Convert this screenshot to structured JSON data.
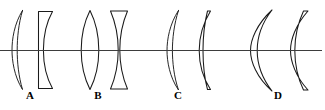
{
  "figure": {
    "background_color": "#ffffff",
    "line_color": "#1a1a1a",
    "axis_color": "#3d3d3d",
    "width": 325,
    "height": 110,
    "axis": {
      "name": "optical-axis",
      "y": 50,
      "x_start": 0,
      "x_end": 322
    }
  },
  "groups": [
    {
      "label": "A",
      "label_x": 30,
      "label_y": 90,
      "elements": [
        {
          "name": "meniscus-lens",
          "shape": "positive-meniscus",
          "center_x": 22
        },
        {
          "name": "plano-concave-lens",
          "shape": "plano-concave",
          "center_x": 45
        }
      ]
    },
    {
      "label": "B",
      "label_x": 98,
      "label_y": 90,
      "elements": [
        {
          "name": "biconvex-lens",
          "shape": "biconvex",
          "center_x": 90
        },
        {
          "name": "biconcave-lens",
          "shape": "biconcave",
          "center_x": 119
        }
      ]
    },
    {
      "label": "C",
      "label_x": 178,
      "label_y": 90,
      "elements": [
        {
          "name": "meniscus-lens",
          "shape": "negative-meniscus",
          "center_x": 172
        },
        {
          "name": "meniscus-lens",
          "shape": "positive-meniscus",
          "center_x": 203
        }
      ]
    },
    {
      "label": "D",
      "label_x": 278,
      "label_y": 90,
      "elements": [
        {
          "name": "deep-meniscus-lens",
          "shape": "negative-meniscus",
          "center_x": 258
        },
        {
          "name": "meniscus-lens",
          "shape": "positive-meniscus",
          "center_x": 295
        }
      ]
    }
  ],
  "labels": {
    "a": "A",
    "b": "B",
    "c": "C",
    "d": "D"
  }
}
